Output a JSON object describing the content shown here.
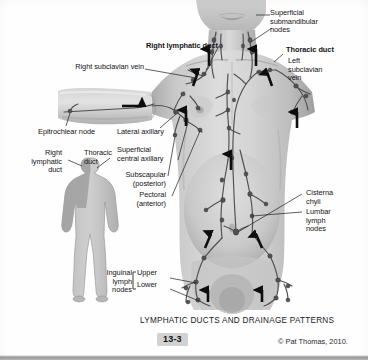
{
  "figure": {
    "caption": "LYMPHATIC DUCTS AND DRAINAGE PATTERNS",
    "number": "13-3",
    "copyright": "© Pat Thomas, 2010.",
    "style": "grayscale medical illustration"
  },
  "labels": {
    "superficial_submandibular_nodes": "Superficial\nsubmandibular\nnodes",
    "right_lymphatic_duct": "Right lymphatic duct",
    "thoracic_duct": "Thoracic duct",
    "right_subclavian_vein": "Right subclavian vein",
    "left_subclavian_vein": "Left\nsubclavian\nvein",
    "epitrochlear_node": "Epitrochlear node",
    "lateral_axillary": "Lateral axillary",
    "superficial_central_axillary": "Superficial\ncentral axillary",
    "subscapular_posterior": "Subscapular\n(posterior)",
    "pectoral_anterior": "Pectoral\n(anterior)",
    "cisterna_chyli": "Cisterna\nchyli",
    "lumbar_lymph_nodes": "Lumbar\nlymph\nnodes",
    "inguinal_lymph_nodes": "Inguinal\nlymph\nnodes",
    "inguinal_upper": "Upper",
    "inguinal_lower": "Lower",
    "inset_right_lymphatic_duct": "Right\nlymphatic\nduct",
    "inset_thoracic_duct": "Thoracic\nduct"
  },
  "inset": {
    "description": "small full-body silhouette showing drainage territories",
    "right_duct_region_label": "right lymphatic duct territory (darker shading: right head, neck, arm and upper chest)",
    "thoracic_duct_region_label": "thoracic duct territory (lighter shading: remainder of body)"
  },
  "colors": {
    "page_background": "#fefefe",
    "label_text": "#141414",
    "leader_line": "#1c1c1c",
    "arrow": "#0d0d0d",
    "skin_light": "#dcdcdc",
    "skin_mid": "#bdbdbd",
    "skin_shadow": "#9a9a9a",
    "vessel": "#5d5d5d",
    "vessel_dark": "#3a3a3a",
    "inset_body_light": "#c9c9c9",
    "inset_body_dark": "#a2a2a2",
    "fignum_background": "#d2d2d2",
    "bottom_rule": "#9a9a9a"
  }
}
